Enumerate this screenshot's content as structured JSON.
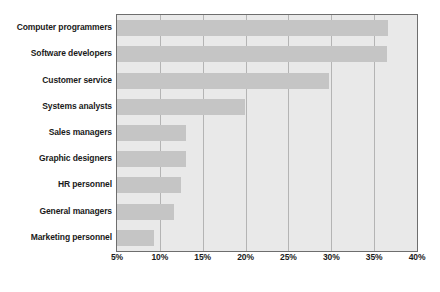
{
  "chart_data": {
    "type": "bar",
    "orientation": "horizontal",
    "title": "",
    "subtitle": "",
    "xlabel": "",
    "ylabel": "",
    "categories": [
      "Computer programmers",
      "Software developers",
      "Customer service",
      "Systems analysts",
      "Sales managers",
      "Graphic designers",
      "HR personnel",
      "General managers",
      "Marketing personnel"
    ],
    "values": [
      36.6,
      36.5,
      29.7,
      19.9,
      13.0,
      13.0,
      12.5,
      11.7,
      9.3
    ],
    "value_suffix": "%",
    "xlim": [
      5,
      40
    ],
    "xticks": [
      5,
      10,
      15,
      20,
      25,
      30,
      35,
      40
    ],
    "xtick_labels": [
      "5%",
      "10%",
      "15%",
      "20%",
      "25%",
      "30%",
      "35%",
      "40%"
    ],
    "grid": true,
    "grid_axis": "x",
    "legend": false,
    "legend_position": "none",
    "series": [
      {
        "name": "",
        "values": [
          36.6,
          36.5,
          29.7,
          19.9,
          13.0,
          13.0,
          12.5,
          11.7,
          9.3
        ]
      }
    ]
  },
  "style": {
    "bar_color": "#c5c5c5",
    "plot_background": "#e9e9e9",
    "plot_border": "#6e6e6e",
    "gridline_color": "#b4b4b4",
    "text_color": "#1a1a1a",
    "page_background": "#ffffff"
  }
}
